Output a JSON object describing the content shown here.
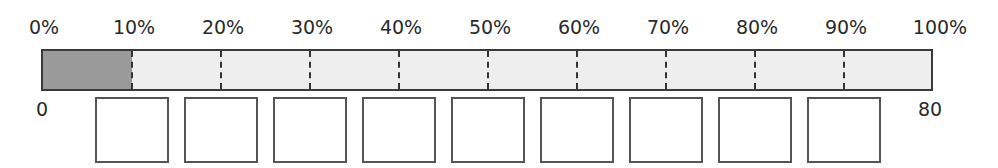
{
  "scale": {
    "labels": [
      "0%",
      "10%",
      "20%",
      "30%",
      "40%",
      "50%",
      "60%",
      "70%",
      "80%",
      "90%",
      "100%"
    ]
  },
  "bar": {
    "filled_percent": 10,
    "fill_color": "#9a9a9a",
    "empty_color": "#eeeeee",
    "divider_style": "dashed"
  },
  "range": {
    "start_label": "0",
    "end_label": "80"
  },
  "boxes": {
    "count": 9,
    "values": [
      "",
      "",
      "",
      "",
      "",
      "",
      "",
      "",
      ""
    ]
  }
}
